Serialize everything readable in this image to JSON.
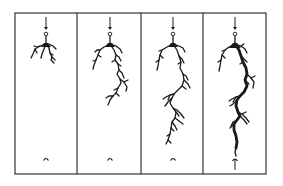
{
  "diagram": {
    "title": "",
    "type": "electrical-tree-growth-sequence",
    "frame": {
      "x": 15,
      "y": 13,
      "w": 251,
      "h": 161,
      "stroke": "#333333"
    },
    "colors": {
      "tree": "#1a1a1a",
      "frame": "#333333",
      "background": "#ffffff"
    },
    "panels": [
      {
        "id": "stage-1",
        "x0": 15,
        "x1": 77,
        "cx": 46,
        "tree_paths": [
          "M46,36 L46,44",
          "M46,44 L40,46 L35,49 L33,54 L31,58",
          "M40,46 L37,47 L34,46",
          "M35,49 L37,53",
          "M46,44 L44,49 L42,54 L41,58",
          "M46,44 L49,48 L50,53 L52,57 L51,60 L54,63",
          "M49,44 L53,46 L56,49",
          "M50,53 L53,55",
          "M52,57 L55,60"
        ],
        "trunk_paths": [
          "M44,43 L48,43 L51,47 L41,47 Z"
        ],
        "bottom_electrode": "cap"
      },
      {
        "id": "stage-2",
        "x0": 77,
        "x1": 141,
        "cx": 110,
        "tree_paths": [
          "M110,36 L110,44",
          "M110,44 L104,47 L100,50 L98,55 L96,60 L94,65 L93,69",
          "M100,50 L97,50 L95,52",
          "M98,55 L101,57",
          "M96,60 L93,61",
          "M110,44 L116,46 L120,49 L122,53",
          "M110,44 L114,50 L116,55 L115,60 L118,64 L119,70 L117,74 L120,79 L121,83 L118,88 L116,93 L113,96 L110,100 L108,105",
          "M116,55 L119,57 L121,61",
          "M115,60 L112,62",
          "M118,64 L121,66",
          "M119,70 L122,73 L124,78",
          "M120,79 L124,82 L127,87 L126,91",
          "M124,82 L128,80",
          "M118,88 L114,90",
          "M116,93 L119,96",
          "M113,96 L109,96 L106,98"
        ],
        "trunk_paths": [
          "M108,43 L112,43 L115,47 L105,47 Z"
        ],
        "bottom_electrode": "cap"
      },
      {
        "id": "stage-3",
        "x0": 141,
        "x1": 203,
        "cx": 173,
        "tree_paths": [
          "M173,36 L173,44",
          "M173,44 L167,47 L162,50 L160,55 L159,60 L158,66 L157,70",
          "M162,50 L159,51",
          "M160,55 L163,58",
          "M159,60 L156,62",
          "M173,44 L179,46 L183,48 L185,52",
          "M173,44 L177,50 L179,56 L181,62 L180,68 L183,74 L184,80 L182,86 L178,90 L174,94 L172,98 L170,103 L173,108 L176,112 L175,118 L172,122 L171,128 L170,134 L168,140 L166,144",
          "M179,56 L182,59 L184,63",
          "M181,62 L178,64",
          "M183,74 L186,76 L188,80",
          "M184,80 L188,84 L190,88",
          "M182,86 L186,89",
          "M174,94 L170,95 L166,97 L163,99",
          "M170,95 L168,100",
          "M172,98 L168,102 L165,106",
          "M173,108 L177,110 L181,114 L184,118",
          "M176,112 L179,116",
          "M175,118 L179,121 L183,124",
          "M172,122 L175,126 L177,130",
          "M171,128 L174,131",
          "M170,134 L167,136",
          "M168,140 L171,143"
        ],
        "trunk_paths": [
          "M171,43 L175,43 L178,47 L168,47 Z"
        ],
        "bottom_electrode": "cap"
      },
      {
        "id": "stage-4",
        "x0": 203,
        "x1": 266,
        "cx": 235,
        "tree_paths": [
          "M235,36 L235,44",
          "M235,44 L229,47 L225,50 L222,55 L221,60 L220,66 L219,71",
          "M225,50 L222,51",
          "M222,55 L225,58",
          "M221,60 L218,62",
          "M235,44 L241,46 L245,49 L247,53",
          "M241,46 L244,44",
          "M235,44 L239,50 L241,56 L243,62 L246,68 L247,74 L245,80 L247,86 L244,92 L240,96 L237,100 L236,106 L238,112 L240,116 L237,120 L234,124 L234,130 L236,136 L237,142 L236,148 L235,152 L236,156",
          "M241,56 L244,59 L247,62",
          "M243,62 L240,64",
          "M247,74 L251,78 L254,82 L253,88",
          "M251,78 L255,76",
          "M245,80 L249,84",
          "M240,96 L236,97 L232,99 L229,101",
          "M236,97 L233,102",
          "M237,100 L233,104 L230,106",
          "M238,112 L242,114 L246,118 L249,122",
          "M242,114 L246,112",
          "M240,116 L244,120 L247,124",
          "M237,120 L233,122 L231,126",
          "M234,124 L230,128"
        ],
        "thick_paths": [
          "M235,44 L239,50 L241,56 L243,62 L246,68 L247,74 L245,80 L247,86 L244,92 L240,96 L237,100 L236,106 L238,112 L240,116 L237,120 L234,124 L234,130 L236,136 L237,142 L236,148"
        ],
        "trunk_paths": [
          "M233,43 L237,43 L241,48 L229,48 Z"
        ],
        "bottom_electrode": "needle"
      }
    ],
    "needle": {
      "arrow_top_y": 17,
      "arrow_bottom_y": 30,
      "circle_y": 34,
      "circle_r": 1.8
    },
    "bottom_cap_y": 159,
    "bottom_needle": {
      "circle_y": 160,
      "line_bottom_y": 170
    }
  }
}
